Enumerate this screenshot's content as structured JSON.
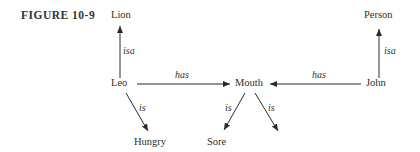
{
  "figure": {
    "title": "FIGURE 10-9"
  },
  "nodes": {
    "lion": "Lion",
    "leo": "Leo",
    "mouth": "Mouth",
    "john": "John",
    "person": "Person",
    "hungry": "Hungry",
    "sore": "Sore"
  },
  "edges": [
    {
      "from": "Leo",
      "to": "Lion",
      "label": "isa"
    },
    {
      "from": "Leo",
      "to": "Mouth",
      "label": "has"
    },
    {
      "from": "John",
      "to": "Mouth",
      "label": "has"
    },
    {
      "from": "John",
      "to": "Person",
      "label": "isa"
    },
    {
      "from": "Leo",
      "to": "Hungry",
      "label": "is"
    },
    {
      "from": "Mouth",
      "to": "Sore",
      "label": "is"
    },
    {
      "from": "Mouth",
      "to": "",
      "label": "is"
    }
  ]
}
